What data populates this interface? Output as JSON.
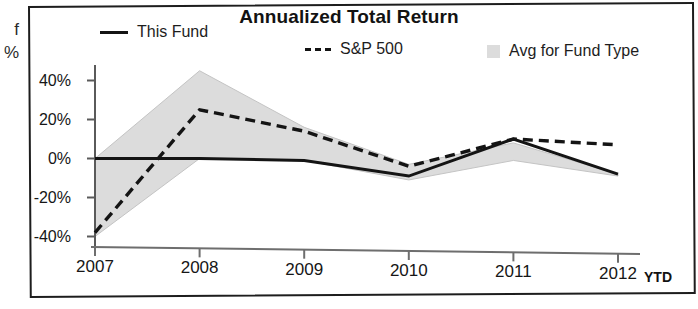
{
  "page_fragments": [
    "f",
    "%"
  ],
  "chart": {
    "title": "Annualized Total Return",
    "x_unit_label": "YTD",
    "legend": [
      {
        "key": "solid-line",
        "label": "This Fund"
      },
      {
        "key": "dashed-line",
        "label": "S&P 500"
      },
      {
        "key": "gray-swatch",
        "label": "Avg for Fund Type"
      }
    ],
    "colors": {
      "this_fund": "#141414",
      "sp500": "#141414",
      "avg_band": "#dcdcdc",
      "axis": "#5a5a5a",
      "frame": "#1d1d1d"
    }
  },
  "chart_data": {
    "type": "line",
    "title": "Annualized Total Return",
    "xlabel": "",
    "ylabel": "",
    "categories": [
      "2007",
      "2008",
      "2009",
      "2010",
      "2011",
      "2012"
    ],
    "x_tick_labels": [
      "2007",
      "2008",
      "2009",
      "2010",
      "2011",
      "2012"
    ],
    "x_unit": "YTD",
    "y_tick_labels": [
      "40%",
      "20%",
      "0%",
      "-20%",
      "-40%"
    ],
    "y_ticks": [
      40,
      20,
      0,
      -20,
      -40
    ],
    "ylim": [
      -45,
      48
    ],
    "y_unit": "%",
    "grid": false,
    "legend_position": "top",
    "series": [
      {
        "name": "This Fund",
        "style": "solid",
        "color": "#141414",
        "values": [
          0,
          0,
          -1,
          -9,
          10,
          -8
        ]
      },
      {
        "name": "S&P 500",
        "style": "dashed",
        "color": "#141414",
        "values": [
          -38,
          25,
          14,
          -4,
          10,
          7
        ]
      },
      {
        "name": "Avg for Fund Type",
        "style": "band",
        "color": "#dcdcdc",
        "band_upper": [
          0,
          45,
          16,
          -3,
          8,
          -8
        ],
        "band_lower": [
          -40,
          0,
          -1,
          -11,
          -1,
          -9
        ]
      }
    ]
  }
}
